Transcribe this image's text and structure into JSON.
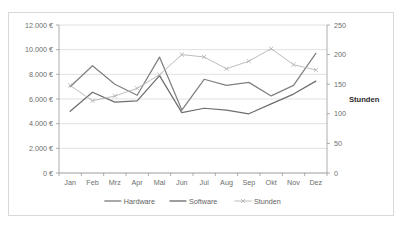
{
  "chart_data": {
    "type": "line",
    "title": "",
    "xlabel": "",
    "ylabel": "",
    "categories": [
      "Jan",
      "Feb",
      "Mrz",
      "Apr",
      "Mai",
      "Jun",
      "Jul",
      "Aug",
      "Sep",
      "Okt",
      "Nov",
      "Dez"
    ],
    "grid": true,
    "legend_position": "bottom",
    "axes": {
      "left": {
        "label": "",
        "ylim": [
          0,
          12000
        ],
        "ticks": [
          0,
          2000,
          4000,
          6000,
          8000,
          10000,
          12000
        ],
        "tick_labels": [
          "0 €",
          "2.000 €",
          "4.000 €",
          "6.000 €",
          "8.000 €",
          "10.000 €",
          "12.000 €"
        ]
      },
      "right": {
        "label": "Stunden",
        "ylim": [
          0,
          250
        ],
        "ticks": [
          0,
          50,
          100,
          150,
          200,
          250
        ],
        "tick_labels": [
          "0",
          "50",
          "100",
          "150",
          "200",
          "250"
        ]
      }
    },
    "series": [
      {
        "name": "Hardware",
        "axis": "left",
        "color": "#808080",
        "marker": "none",
        "values": [
          7000,
          8700,
          7200,
          6300,
          9400,
          5100,
          7600,
          7100,
          7350,
          6250,
          7100,
          9700
        ]
      },
      {
        "name": "Software",
        "axis": "left",
        "color": "#6e6e6e",
        "marker": "none",
        "values": [
          5000,
          6550,
          5750,
          5850,
          7900,
          4900,
          5250,
          5100,
          4800,
          5600,
          6400,
          7450
        ]
      },
      {
        "name": "Stunden",
        "axis": "right",
        "color": "#b5b5b5",
        "marker": "x",
        "values": [
          148,
          122,
          130,
          143,
          166,
          200,
          196,
          176,
          189,
          210,
          183,
          174
        ]
      }
    ]
  },
  "legend": {
    "items": [
      {
        "label": "Hardware"
      },
      {
        "label": "Software"
      },
      {
        "label": "Stunden"
      }
    ]
  },
  "right_axis_title": "Stunden"
}
